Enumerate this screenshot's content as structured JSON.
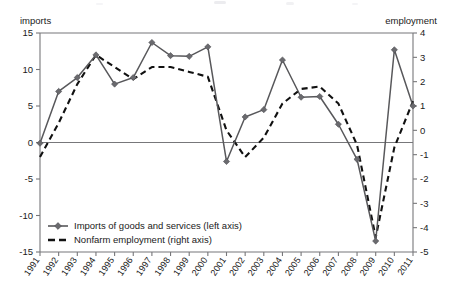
{
  "axes": {
    "left_caption": "imports",
    "right_caption": "employment",
    "left_ticks": [
      "15",
      "10",
      "5",
      "0",
      "-5",
      "-10",
      "-15"
    ],
    "right_ticks": [
      "4",
      "3",
      "2",
      "1",
      "0",
      "-1",
      "-2",
      "-3",
      "-4",
      "-5"
    ]
  },
  "legend": {
    "items": [
      {
        "label": "Imports of goods and services (left axis)",
        "style": "solid-marker",
        "color": "#58585b"
      },
      {
        "label": "Nonfarm employment (right axis)",
        "style": "dashed",
        "color": "#111111"
      }
    ]
  },
  "chart_data": {
    "type": "line",
    "title": "",
    "subtitle": "",
    "xlabel": "",
    "ylabel": "imports",
    "y2label": "employment",
    "grid": false,
    "legend_position": "inside-bottom-left",
    "categories": [
      "1991",
      "1992",
      "1993",
      "1994",
      "1995",
      "1996",
      "1997",
      "1998",
      "1999",
      "2000",
      "2001",
      "2002",
      "2003",
      "2004",
      "2005",
      "2006",
      "2007",
      "2008",
      "2009",
      "2010",
      "2011"
    ],
    "ylim": [
      -15,
      15
    ],
    "y2lim": [
      -5,
      4
    ],
    "yticks": [
      15,
      10,
      5,
      0,
      -5,
      -10,
      -15
    ],
    "y2ticks": [
      4,
      3,
      2,
      1,
      0,
      -1,
      -2,
      -3,
      -4,
      -5
    ],
    "series": [
      {
        "name": "Imports of goods and services (left axis)",
        "axis": "left",
        "style": "solid",
        "marker": "diamond",
        "color": "#58585b",
        "values": [
          -0.1,
          7.0,
          8.9,
          12.0,
          8.0,
          8.9,
          13.7,
          11.9,
          11.8,
          13.1,
          -2.6,
          3.5,
          4.5,
          11.3,
          6.2,
          6.3,
          2.5,
          -2.3,
          -13.5,
          12.7,
          5.0
        ]
      },
      {
        "name": "Nonfarm employment (right axis)",
        "axis": "right",
        "style": "dashed",
        "marker": "none",
        "color": "#111111",
        "values": [
          -1.1,
          0.3,
          1.9,
          3.1,
          2.6,
          2.1,
          2.6,
          2.6,
          2.4,
          2.2,
          0.0,
          -1.1,
          -0.3,
          1.1,
          1.7,
          1.8,
          1.1,
          -0.6,
          -4.4,
          -0.7,
          1.2
        ]
      }
    ]
  },
  "plot_geometry": {
    "left_px": 40,
    "right_px": 413,
    "top_px": 33,
    "bottom_px": 252
  }
}
